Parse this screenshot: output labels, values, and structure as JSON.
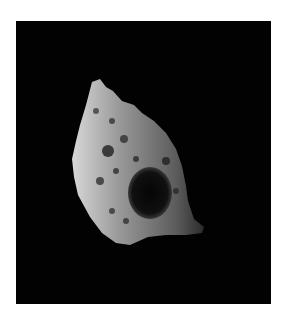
{
  "image": {
    "subject": "irregular cratered moon on black space background",
    "background_color": "#020202",
    "border_color": "#ffffff",
    "body_color": "#8a8a8a"
  }
}
